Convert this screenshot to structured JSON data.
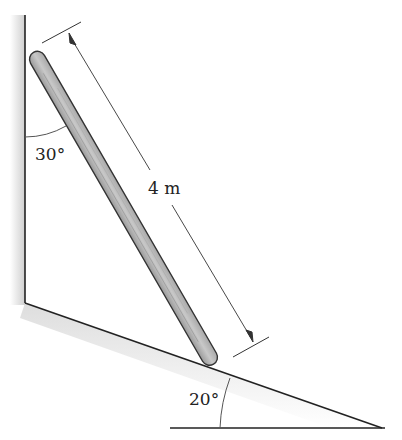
{
  "figure": {
    "type": "ladder-against-wall-on-incline",
    "labels": {
      "length": "4 m",
      "wall_angle": "30°",
      "incline_angle": "20°"
    },
    "colors": {
      "line": "#222222",
      "ladder_fill": "#b8b8b8",
      "ladder_stroke": "#333333",
      "shadow": "#d6d6d6"
    }
  }
}
